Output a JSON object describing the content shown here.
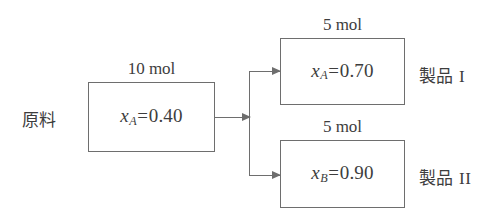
{
  "diagram": {
    "line_color": "#6e6e6e",
    "text_color": "#3d3d3d",
    "background": "#ffffff",
    "feed": {
      "side_label": "原料",
      "amount": "10 mol",
      "composition": {
        "symbol": "x",
        "subscript": "A",
        "equals": "=",
        "value": "0.40",
        "full": "xA=0.40"
      }
    },
    "products": [
      {
        "side_label": "製品",
        "roman": "I",
        "amount": "5 mol",
        "composition": {
          "symbol": "x",
          "subscript": "A",
          "equals": "=",
          "value": "0.70",
          "full": "xA=0.70"
        }
      },
      {
        "side_label": "製品",
        "roman": "II",
        "amount": "5 mol",
        "composition": {
          "symbol": "x",
          "subscript": "B",
          "equals": "=",
          "value": "0.90",
          "full": "xB=0.90"
        }
      }
    ],
    "connectors": {
      "feed_arrow": "arrow-right",
      "split_arrow_top": "arrow-right",
      "split_arrow_bottom": "arrow-right"
    }
  }
}
